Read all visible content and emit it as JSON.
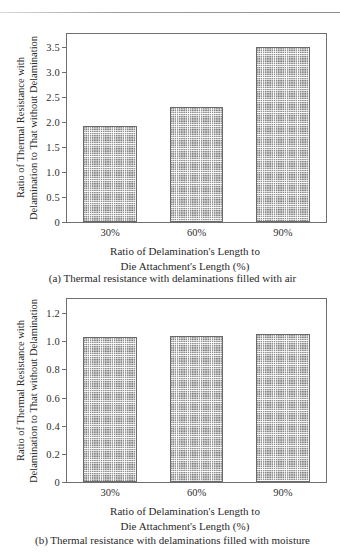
{
  "figure_a": {
    "caption": "(a) Thermal resistance with delaminations filled with air",
    "ylabel_line1": "Ratio of Thermal Resistance with",
    "ylabel_line2": "Delamination to That without Delamination",
    "xlabel_line1": "Ratio of Delamination's Length to",
    "xlabel_line2": "Die Attachment's Length (%)"
  },
  "figure_b": {
    "caption": "(b) Thermal resistance with delaminations filled with moisture",
    "ylabel_line1": "Ratio of Thermal Resistance with",
    "ylabel_line2": "Delamination to That without Delamination",
    "xlabel_line1": "Ratio of Delamination's Length to",
    "xlabel_line2": "Die Attachment's Length (%)"
  },
  "chart_data": [
    {
      "type": "bar",
      "id": "a",
      "title": "(a) Thermal resistance with delaminations filled with air",
      "categories": [
        "30%",
        "60%",
        "90%"
      ],
      "values": [
        1.92,
        2.29,
        3.5
      ],
      "xlabel": "Ratio of Delamination's Length to Die Attachment's Length (%)",
      "ylabel": "Ratio of Thermal Resistance with Delamination to That without Delamination",
      "yticks": [
        "0",
        "0.5",
        "1.0",
        "1.5",
        "2.0",
        "2.5",
        "3.0",
        "3.5"
      ],
      "ytick_values": [
        0,
        0.5,
        1.0,
        1.5,
        2.0,
        2.5,
        3.0,
        3.5
      ],
      "ylim": [
        0,
        3.75
      ],
      "grid": false,
      "legend": "none",
      "bar_fill": "crosshatch"
    },
    {
      "type": "bar",
      "id": "b",
      "title": "(b) Thermal resistance with delaminations filled with moisture",
      "categories": [
        "30%",
        "60%",
        "90%"
      ],
      "values": [
        1.03,
        1.04,
        1.055
      ],
      "xlabel": "Ratio of Delamination's Length to Die Attachment's Length (%)",
      "ylabel": "Ratio of Thermal Resistance with Delamination to That without Delamination",
      "yticks": [
        "0",
        "0.2",
        "0.4",
        "0.6",
        "0.8",
        "1.0",
        "1.2"
      ],
      "ytick_values": [
        0,
        0.2,
        0.4,
        0.6,
        0.8,
        1.0,
        1.2
      ],
      "ylim": [
        0,
        1.3
      ],
      "grid": false,
      "legend": "none",
      "bar_fill": "crosshatch"
    }
  ]
}
